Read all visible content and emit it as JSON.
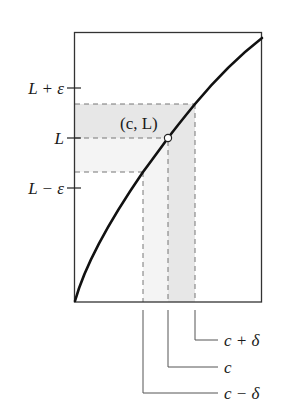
{
  "diagram": {
    "title": "",
    "point_label": "(c, L)",
    "y_ticks": [
      {
        "label": "L + ε",
        "y": 88
      },
      {
        "label": "L",
        "y": 138
      },
      {
        "label": "L − ε",
        "y": 188
      }
    ],
    "x_labels": [
      {
        "label": "c + δ",
        "x": 195,
        "leader_y": 340
      },
      {
        "label": "c",
        "x": 168,
        "leader_y": 367
      },
      {
        "label": "c − δ",
        "x": 143,
        "leader_y": 393
      }
    ],
    "colors": {
      "axis": "#333333",
      "curve": "#111111",
      "dash": "#777777",
      "shade_dark": "#e6e6e6",
      "shade_light": "#f3f3f3",
      "leader": "#555555"
    }
  }
}
